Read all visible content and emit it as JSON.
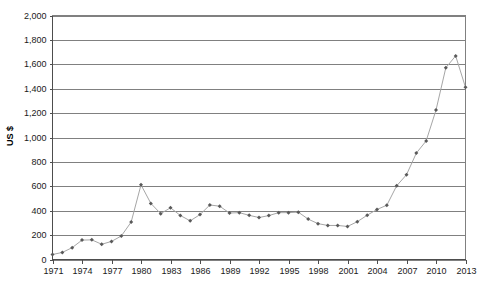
{
  "chart_data": {
    "type": "line",
    "title": "",
    "xlabel": "",
    "ylabel": "US $",
    "xlim": [
      1971,
      2013
    ],
    "ylim": [
      0,
      2000
    ],
    "ytick_step": 200,
    "xtick_step": 3,
    "grid": true,
    "legend": "none",
    "marker": "diamond",
    "line_color": "#a6a6a6",
    "marker_color": "#595959",
    "grid_color": "#808080",
    "y_ticks": [
      "0",
      "200",
      "400",
      "600",
      "800",
      "1,000",
      "1,200",
      "1,400",
      "1,600",
      "1,800",
      "2,000"
    ],
    "y_tick_values": [
      0,
      200,
      400,
      600,
      800,
      1000,
      1200,
      1400,
      1600,
      1800,
      2000
    ],
    "x_ticks": [
      "1971",
      "1974",
      "1977",
      "1980",
      "1983",
      "1986",
      "1989",
      "1992",
      "1995",
      "1998",
      "2001",
      "2004",
      "2007",
      "2010",
      "2013"
    ],
    "x_tick_values": [
      1971,
      1974,
      1977,
      1980,
      1983,
      1986,
      1989,
      1992,
      1995,
      1998,
      2001,
      2004,
      2007,
      2010,
      2013
    ],
    "x": [
      1971,
      1972,
      1973,
      1974,
      1975,
      1976,
      1977,
      1978,
      1979,
      1980,
      1981,
      1982,
      1983,
      1984,
      1985,
      1986,
      1987,
      1988,
      1989,
      1990,
      1991,
      1992,
      1993,
      1994,
      1995,
      1996,
      1997,
      1998,
      1999,
      2000,
      2001,
      2002,
      2003,
      2004,
      2005,
      2006,
      2007,
      2008,
      2009,
      2010,
      2011,
      2012,
      2013
    ],
    "values": [
      41,
      58,
      97,
      159,
      161,
      125,
      148,
      193,
      307,
      612,
      460,
      376,
      424,
      361,
      317,
      368,
      447,
      437,
      381,
      384,
      362,
      344,
      360,
      384,
      384,
      388,
      331,
      294,
      279,
      279,
      271,
      310,
      363,
      410,
      445,
      604,
      695,
      872,
      972,
      1225,
      1572,
      1669,
      1411
    ],
    "series": [
      {
        "name": "Gold price",
        "values": [
          41,
          58,
          97,
          159,
          161,
          125,
          148,
          193,
          307,
          612,
          460,
          376,
          424,
          361,
          317,
          368,
          447,
          437,
          381,
          384,
          362,
          344,
          360,
          384,
          384,
          388,
          331,
          294,
          279,
          279,
          271,
          310,
          363,
          410,
          445,
          604,
          695,
          872,
          972,
          1225,
          1572,
          1669,
          1411
        ]
      }
    ],
    "annotations": []
  }
}
